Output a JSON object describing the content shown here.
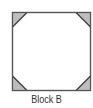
{
  "figure": {
    "label": "Block B",
    "shape": "square",
    "colors": {
      "border": "#555555",
      "fill": "#ffffff",
      "corner_fill": "#bdbdbd",
      "corner_edge": "#3a3a3a"
    },
    "corners": [
      {
        "position": "top-left",
        "name": "corner-triangle-top-left"
      },
      {
        "position": "top-right",
        "name": "corner-triangle-top-right"
      },
      {
        "position": "bottom-left",
        "name": "corner-triangle-bottom-left"
      },
      {
        "position": "bottom-right",
        "name": "corner-triangle-bottom-right"
      }
    ]
  }
}
